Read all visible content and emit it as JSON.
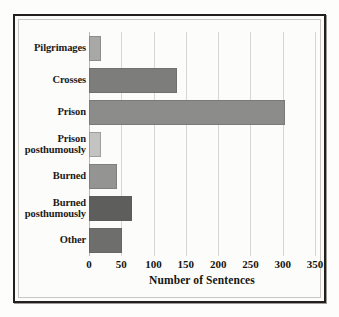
{
  "chart_data": {
    "type": "bar",
    "orientation": "horizontal",
    "title": "",
    "xlabel": "Number of Sentences",
    "ylabel": "",
    "xlim": [
      0,
      350
    ],
    "xticks": [
      0,
      50,
      100,
      150,
      200,
      250,
      300,
      350
    ],
    "xtick_labels": [
      "0",
      "50",
      "100",
      "150",
      "200",
      "250",
      "300",
      "350"
    ],
    "grid": true,
    "grid_axis": "x",
    "legend": "none",
    "categories": [
      "Pilgrimages",
      "Crosses",
      "Prison",
      "Prison posthumously",
      "Burned",
      "Burned posthumously",
      "Other"
    ],
    "category_lines": [
      [
        "Pilgrimages"
      ],
      [
        "Crosses"
      ],
      [
        "Prison"
      ],
      [
        "Prison",
        "posthumously"
      ],
      [
        "Burned"
      ],
      [
        "Burned",
        "posthumously"
      ],
      [
        "Other"
      ]
    ],
    "values": [
      19,
      136,
      304,
      19,
      43,
      67,
      51
    ],
    "bar_colors": [
      "#a8a8a6",
      "#7d7d7b",
      "#8c8c8a",
      "#c3c3c1",
      "#949492",
      "#5e5e5c",
      "#6e6e6c"
    ]
  },
  "figure": {
    "background": "#fdfdfc",
    "plot_background": "#fcfcfa",
    "frame_color": "#231f1d",
    "gridline_color": "#d8d6d1",
    "text_color": "#16150f"
  }
}
